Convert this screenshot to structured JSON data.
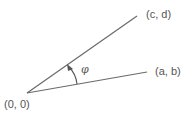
{
  "diagram": {
    "origin_label": "(0, 0)",
    "point_cd_label": "(c, d)",
    "point_ab_label": "(a, b)",
    "angle_label": "φ",
    "line_color": "#6a6a6a",
    "text_color": "#555555"
  }
}
